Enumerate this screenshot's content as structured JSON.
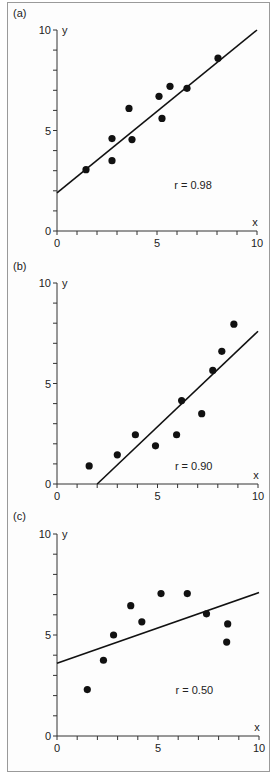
{
  "chart_data": [
    {
      "type": "scatter",
      "panel_label": "(a)",
      "xlabel": "x",
      "ylabel": "y",
      "xlim": [
        0,
        10
      ],
      "ylim": [
        0,
        10
      ],
      "x_tick_labels": [
        "0",
        "5",
        "10"
      ],
      "y_tick_labels": [
        "0",
        "5",
        "10"
      ],
      "annotation": "r = 0.98",
      "points": [
        [
          1.45,
          3.05
        ],
        [
          2.75,
          4.6
        ],
        [
          2.75,
          3.5
        ],
        [
          3.6,
          6.1
        ],
        [
          3.75,
          4.55
        ],
        [
          5.1,
          6.7
        ],
        [
          5.25,
          5.6
        ],
        [
          5.65,
          7.2
        ],
        [
          6.5,
          7.1
        ],
        [
          8.05,
          8.6
        ]
      ],
      "fit_line": [
        [
          0,
          1.9
        ],
        [
          10,
          10
        ]
      ],
      "grid": false
    },
    {
      "type": "scatter",
      "panel_label": "(b)",
      "xlabel": "x",
      "ylabel": "y",
      "xlim": [
        0,
        10
      ],
      "ylim": [
        0,
        10
      ],
      "x_tick_labels": [
        "0",
        "5",
        "10"
      ],
      "y_tick_labels": [
        "0",
        "5",
        "10"
      ],
      "annotation": "r = 0.90",
      "points": [
        [
          1.6,
          0.9
        ],
        [
          3.0,
          1.45
        ],
        [
          3.9,
          2.45
        ],
        [
          4.9,
          1.9
        ],
        [
          5.95,
          2.45
        ],
        [
          6.2,
          4.15
        ],
        [
          7.2,
          3.5
        ],
        [
          7.75,
          5.65
        ],
        [
          8.2,
          6.6
        ],
        [
          8.8,
          7.95
        ]
      ],
      "fit_line": [
        [
          2.0,
          0
        ],
        [
          10,
          7.6
        ]
      ],
      "grid": false
    },
    {
      "type": "scatter",
      "panel_label": "(c)",
      "xlabel": "x",
      "ylabel": "y",
      "xlim": [
        0,
        10
      ],
      "ylim": [
        0,
        10
      ],
      "x_tick_labels": [
        "0",
        "5",
        "10"
      ],
      "y_tick_labels": [
        "0",
        "5",
        "10"
      ],
      "annotation": "r = 0.50",
      "points": [
        [
          1.5,
          2.3
        ],
        [
          2.3,
          3.75
        ],
        [
          2.8,
          5.0
        ],
        [
          3.65,
          6.45
        ],
        [
          4.2,
          5.65
        ],
        [
          5.15,
          7.05
        ],
        [
          6.45,
          7.05
        ],
        [
          7.4,
          6.05
        ],
        [
          8.45,
          5.55
        ],
        [
          8.4,
          4.65
        ]
      ],
      "fit_line": [
        [
          0,
          3.6
        ],
        [
          10,
          7.1
        ]
      ],
      "grid": false
    }
  ],
  "layout": {
    "panels": [
      {
        "origin": [
          57,
          231
        ],
        "x_unit": 20.0,
        "y_unit": 20.1,
        "label_pos": [
          13,
          17
        ]
      },
      {
        "origin": [
          57,
          484
        ],
        "x_unit": 20.1,
        "y_unit": 20.1,
        "label_pos": [
          13,
          270
        ]
      },
      {
        "origin": [
          57,
          736
        ],
        "x_unit": 20.2,
        "y_unit": 20.2,
        "label_pos": [
          13,
          520
        ]
      }
    ]
  }
}
